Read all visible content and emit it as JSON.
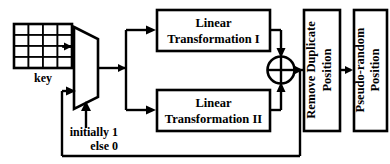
{
  "diagram": {
    "key_block": {
      "label": "key",
      "grid_rows": 4,
      "grid_cols": 4,
      "icon": "key-matrix-icon"
    },
    "mux": {
      "icon": "multiplexer-icon",
      "select_label_line1": "initially 1",
      "select_label_line2": "else 0"
    },
    "blocks": [
      {
        "id": "lt1",
        "line1": "Linear",
        "line2": "Transformation I"
      },
      {
        "id": "lt2",
        "line1": "Linear",
        "line2": "Transformation II"
      }
    ],
    "xor": {
      "icon": "xor-gate-icon",
      "symbol": "crossed-circle"
    },
    "vertical_blocks": [
      {
        "id": "remove-duplicate",
        "line1": "Remove Duplicate",
        "line2": "Position"
      },
      {
        "id": "pseudo-random",
        "line1": "Pseudo-random",
        "line2": "Position"
      }
    ],
    "colors": {
      "stroke": "#000000",
      "fill": "#ffffff",
      "text": "#000000"
    }
  }
}
